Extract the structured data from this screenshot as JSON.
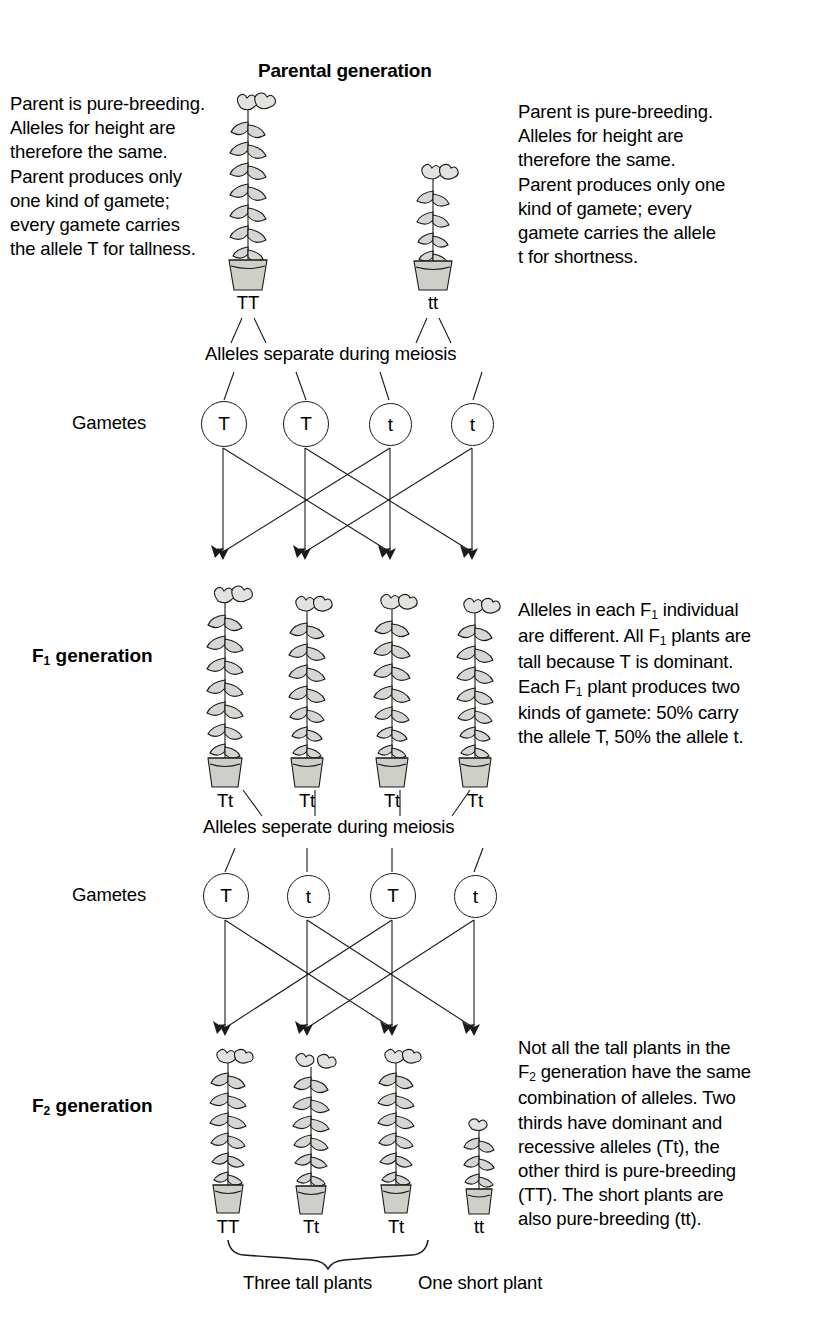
{
  "diagram": {
    "title": "Parental generation",
    "type": "mendelian-monohybrid-cross",
    "trait": "plant height",
    "alleles": {
      "dominant": "T",
      "recessive": "t",
      "dominant_meaning": "tallness",
      "recessive_meaning": "shortness"
    }
  },
  "parental": {
    "left_text": "Parent is pure-breeding.\nAlleles for height are\ntherefore the same.\nParent produces only\none kind of gamete;\nevery gamete carries\nthe allele T for tallness.",
    "right_text": "Parent is pure-breeding.\nAlleles for height are\ntherefore the same.\nParent produces only one\nkind of gamete; every\ngamete carries the allele\nt for shortness.",
    "plants": [
      {
        "genotype": "TT",
        "height": "tall"
      },
      {
        "genotype": "tt",
        "height": "short"
      }
    ],
    "meiosis_text": "Alleles separate during meiosis",
    "gametes_label": "Gametes",
    "gametes": [
      "T",
      "T",
      "t",
      "t"
    ]
  },
  "f1": {
    "label_main": "F",
    "label_sub": "1",
    "label_rest": " generation",
    "plants": [
      {
        "genotype": "Tt",
        "height": "tall"
      },
      {
        "genotype": "Tt",
        "height": "tall"
      },
      {
        "genotype": "Tt",
        "height": "tall"
      },
      {
        "genotype": "Tt",
        "height": "tall"
      }
    ],
    "side_lines": [
      {
        "a": "Alleles in each F",
        "sub": "1",
        "b": " individual"
      },
      {
        "a": "are different. All F",
        "sub": "1",
        "b": " plants are"
      },
      {
        "a": "tall because T is dominant.",
        "sub": "",
        "b": ""
      },
      {
        "a": "Each F",
        "sub": "1",
        "b": " plant produces two"
      },
      {
        "a": "kinds of gamete: 50% carry",
        "sub": "",
        "b": ""
      },
      {
        "a": "the allele T, 50% the allele t.",
        "sub": "",
        "b": ""
      }
    ],
    "meiosis_text": "Alleles seperate during meiosis",
    "gametes_label": "Gametes",
    "gametes": [
      "T",
      "t",
      "T",
      "t"
    ]
  },
  "f2": {
    "label_main": "F",
    "label_sub": "2",
    "label_rest": " generation",
    "plants": [
      {
        "genotype": "TT",
        "height": "tall"
      },
      {
        "genotype": "Tt",
        "height": "tall"
      },
      {
        "genotype": "Tt",
        "height": "tall"
      },
      {
        "genotype": "tt",
        "height": "short"
      }
    ],
    "side_lines": [
      {
        "a": "Not all the tall plants in the",
        "sub": "",
        "b": ""
      },
      {
        "a": "F",
        "sub": "2",
        "b": " generation have the same"
      },
      {
        "a": "combination of alleles. Two",
        "sub": "",
        "b": ""
      },
      {
        "a": "thirds have dominant and",
        "sub": "",
        "b": ""
      },
      {
        "a": "recessive alleles (Tt), the",
        "sub": "",
        "b": ""
      },
      {
        "a": "other third is pure-breeding",
        "sub": "",
        "b": ""
      },
      {
        "a": "(TT). The short plants are",
        "sub": "",
        "b": ""
      },
      {
        "a": "also pure-breeding (tt).",
        "sub": "",
        "b": ""
      }
    ],
    "brace_caption": "Three tall plants",
    "short_caption": "One short plant"
  },
  "colors": {
    "ink": "#000000",
    "background": "#ffffff",
    "plant_fill": "#d6d6d2",
    "pot_fill": "#cfcfc9",
    "line": "#1a1a1a"
  }
}
